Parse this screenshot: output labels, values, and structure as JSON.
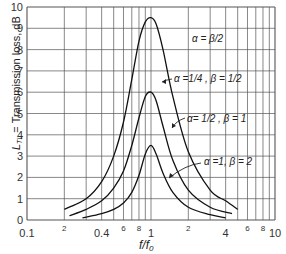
{
  "chart_data": {
    "type": "line",
    "title": "",
    "xlabel": "f/f0",
    "ylabel": "L_TL = Transmission loss, dB",
    "xscale": "log",
    "xlim": [
      0.1,
      10
    ],
    "ylim": [
      0,
      10
    ],
    "grid": true,
    "x_tick_labels": [
      "0.1",
      "2",
      "0.4",
      "6",
      "8",
      "1",
      "2",
      "4",
      "6",
      "8",
      "10"
    ],
    "x_tick_values": [
      0.1,
      0.2,
      0.4,
      0.6,
      0.8,
      1,
      2,
      4,
      6,
      8,
      10
    ],
    "y_tick_labels": [
      "0",
      "1",
      "2",
      "3",
      "4",
      "5",
      "6",
      "7",
      "8",
      "9",
      "10"
    ],
    "series": [
      {
        "name": "α = β/2, α = 1/4, β = 1/2",
        "x": [
          0.2,
          0.3,
          0.4,
          0.5,
          0.6,
          0.7,
          0.8,
          0.9,
          1.0,
          1.1,
          1.25,
          1.5,
          2,
          3,
          4,
          5
        ],
        "y": [
          0.5,
          1.0,
          1.8,
          3.0,
          4.6,
          6.6,
          8.4,
          9.3,
          9.5,
          9.2,
          8.0,
          5.8,
          3.2,
          1.4,
          0.9,
          0.5
        ]
      },
      {
        "name": "α = 1/2, β = 1",
        "x": [
          0.22,
          0.3,
          0.4,
          0.5,
          0.6,
          0.7,
          0.8,
          0.9,
          1.0,
          1.1,
          1.25,
          1.5,
          2,
          3,
          4.5
        ],
        "y": [
          0.2,
          0.5,
          0.9,
          1.5,
          2.3,
          3.5,
          4.8,
          5.8,
          6.0,
          5.6,
          4.4,
          2.8,
          1.4,
          0.6,
          0.3
        ]
      },
      {
        "name": "α = 1, β = 2",
        "x": [
          0.28,
          0.4,
          0.5,
          0.6,
          0.7,
          0.8,
          0.9,
          1.0,
          1.1,
          1.25,
          1.5,
          2,
          3,
          4
        ],
        "y": [
          0.1,
          0.3,
          0.5,
          0.8,
          1.3,
          2.1,
          3.1,
          3.5,
          3.1,
          2.2,
          1.3,
          0.6,
          0.25,
          0.1
        ]
      }
    ],
    "annotations": [
      "α = β/2",
      "α = 1/4, β = 1/2",
      "α = 1/2, β = 1",
      "α = 1, β = 2"
    ]
  },
  "axis": {
    "ylabel": "L",
    "ylabel_sub": "TL",
    "ylabel_rest": " = Transmission loss, dB",
    "xlabel": "f/f",
    "xlabel_sub": "0"
  },
  "annotations": {
    "a1": "α = β/2",
    "a2": "α =1/4 , β = 1/2",
    "a3": "α= 1/2 , β = 1",
    "a4": "α =1,  β = 2"
  }
}
